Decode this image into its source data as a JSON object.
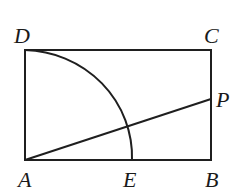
{
  "figure": {
    "type": "geometry",
    "points": {
      "A": {
        "label": "A",
        "x": 25,
        "y": 160
      },
      "B": {
        "label": "B",
        "x": 211,
        "y": 160
      },
      "C": {
        "label": "C",
        "x": 211,
        "y": 50
      },
      "D": {
        "label": "D",
        "x": 25,
        "y": 50
      },
      "E": {
        "label": "E",
        "x": 132,
        "y": 160
      },
      "P": {
        "label": "P",
        "x": 211,
        "y": 99
      }
    },
    "labels": {
      "A": "A",
      "B": "B",
      "C": "C",
      "D": "D",
      "E": "E",
      "P": "P"
    },
    "stroke_color": "#1f1f1f"
  }
}
